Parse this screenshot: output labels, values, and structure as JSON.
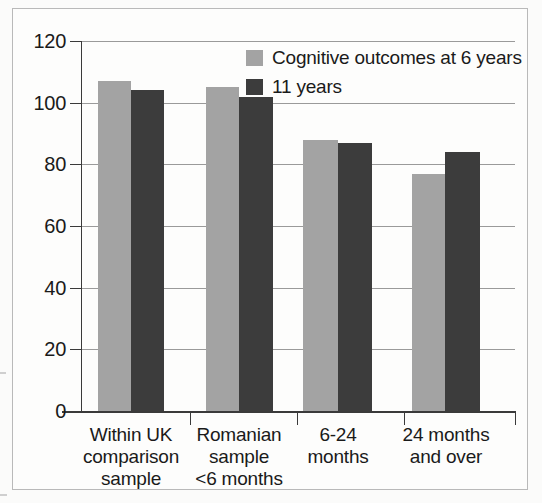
{
  "chart_data": {
    "type": "bar",
    "title": "",
    "xlabel": "",
    "ylabel": "",
    "ylim": [
      0,
      120
    ],
    "yticks": [
      0,
      20,
      40,
      60,
      80,
      100,
      120
    ],
    "grid": true,
    "legend_position": "top-right",
    "categories": [
      "Within UK comparison sample",
      "Romanian sample <6 months",
      "6-24 months",
      "24 months and over"
    ],
    "category_lines": [
      [
        "Within UK",
        "comparison",
        "sample"
      ],
      [
        "Romanian",
        "sample",
        "<6 months"
      ],
      [
        "6-24",
        "months"
      ],
      [
        "24 months",
        "and over"
      ]
    ],
    "series": [
      {
        "name": "Cognitive outcomes at 6 years",
        "color": "#a3a3a3",
        "values": [
          107,
          105,
          88,
          77
        ]
      },
      {
        "name": "11 years",
        "color": "#3c3c3c",
        "values": [
          104,
          102,
          87,
          84
        ]
      }
    ]
  },
  "legend": {
    "items": [
      {
        "label": "Cognitive outcomes at 6 years",
        "swatch": "light"
      },
      {
        "label": "11 years",
        "swatch": "dark"
      }
    ]
  },
  "axis": {
    "y_tick_labels": [
      "120",
      "100",
      "80",
      "60",
      "40",
      "20",
      "0"
    ]
  }
}
